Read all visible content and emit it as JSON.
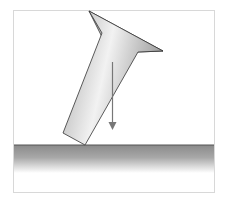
{
  "diagram": {
    "colors": {
      "frame": "#d8d8d8",
      "ground_top": "#808080",
      "ground_fade": "#ffffff",
      "object_light": "#f0f0f0",
      "object_dark": "#9a9a9a",
      "outline": "#333333",
      "arrow": "#777777"
    },
    "elements": [
      "frame",
      "ground",
      "tilted-object",
      "weight-arrow"
    ]
  }
}
